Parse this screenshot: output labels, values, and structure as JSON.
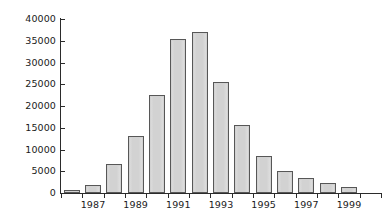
{
  "chart_data": {
    "type": "bar",
    "title": "",
    "subtitle": "",
    "xlabel": "",
    "ylabel": "",
    "categories": [
      "1986",
      "1987",
      "1988",
      "1989",
      "1990",
      "1991",
      "1992",
      "1993",
      "1994",
      "1995",
      "1996",
      "1997",
      "1998",
      "1999",
      "2000"
    ],
    "values": [
      700,
      1800,
      6600,
      13000,
      22600,
      35400,
      37000,
      25600,
      15700,
      8600,
      5000,
      3500,
      2300,
      1400,
      0
    ],
    "ylim": [
      0,
      40000
    ],
    "ytick_values": [
      0,
      5000,
      10000,
      15000,
      20000,
      25000,
      30000,
      35000,
      40000
    ],
    "ytick_labels": [
      "0",
      "5000",
      "10000",
      "15000",
      "20000",
      "25000",
      "30000",
      "35000",
      "40000"
    ],
    "xtick_labels": [
      "1987",
      "1989",
      "1991",
      "1993",
      "1995",
      "1997",
      "1999"
    ],
    "xtick_label_categories": [
      "1987",
      "1989",
      "1991",
      "1993",
      "1995",
      "1997",
      "1999"
    ],
    "grid": false,
    "legend": null,
    "legend_position": "none",
    "bar_fill_color": "#d2d2d2",
    "bar_border_color": "#575757",
    "axis_color": "#2b2b2b",
    "background_color": "#ffffff",
    "annotations": []
  }
}
